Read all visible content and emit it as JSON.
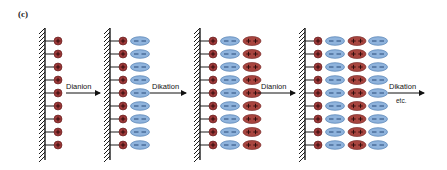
{
  "panel_label": "(c)",
  "colors": {
    "cation": "#9e3a3a",
    "cation_dark": "#5a1414",
    "anion": "#8fb3dc",
    "anion_stroke": "#3d6fa8",
    "dication": "#a8453f",
    "wall": "#1a1a1a"
  },
  "stages": [
    {
      "index": 1,
      "layers": [
        "cation"
      ]
    },
    {
      "index": 2,
      "layers": [
        "cation",
        "dianion"
      ]
    },
    {
      "index": 3,
      "layers": [
        "cation",
        "dianion",
        "dication"
      ]
    },
    {
      "index": 4,
      "layers": [
        "cation",
        "dianion",
        "dication",
        "dianion"
      ]
    }
  ],
  "rows_per_stage": 9,
  "arrows": [
    {
      "label": "Dianion"
    },
    {
      "label": "Dikation"
    },
    {
      "label": "Dianion"
    },
    {
      "label": "Dikation",
      "sublabel": "etc."
    }
  ],
  "symbols": {
    "plus": "+",
    "minus": "−"
  }
}
